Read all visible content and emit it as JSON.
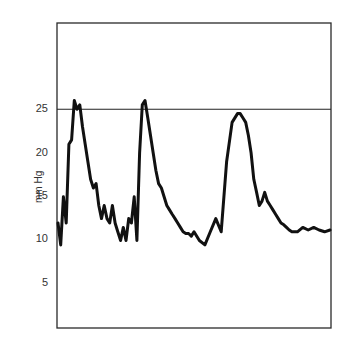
{
  "chart_data": {
    "type": "line",
    "title": "",
    "xlabel": "",
    "ylabel": "mm Hg",
    "ylim": [
      0,
      34
    ],
    "yticks": [
      5,
      10,
      15,
      20,
      25
    ],
    "ytick_labels": [
      "5",
      "10",
      "15",
      "20",
      "25"
    ],
    "reference_line": {
      "y": 25,
      "style": "solid",
      "color": "#222222"
    },
    "grid": false,
    "legend": null,
    "x_axis_ticks": false,
    "series": [
      {
        "name": "pressure waveform",
        "color": "#111111",
        "x": [
          0.0,
          0.01,
          0.02,
          0.03,
          0.04,
          0.05,
          0.06,
          0.07,
          0.08,
          0.09,
          0.1,
          0.11,
          0.12,
          0.13,
          0.14,
          0.15,
          0.16,
          0.17,
          0.18,
          0.19,
          0.2,
          0.21,
          0.22,
          0.23,
          0.24,
          0.25,
          0.26,
          0.27,
          0.28,
          0.29,
          0.3,
          0.31,
          0.32,
          0.33,
          0.34,
          0.35,
          0.36,
          0.37,
          0.38,
          0.39,
          0.4,
          0.41,
          0.42,
          0.43,
          0.44,
          0.45,
          0.46,
          0.47,
          0.48,
          0.49,
          0.5,
          0.52,
          0.54,
          0.56,
          0.58,
          0.6,
          0.62,
          0.64,
          0.66,
          0.67,
          0.68,
          0.69,
          0.7,
          0.71,
          0.72,
          0.73,
          0.74,
          0.75,
          0.76,
          0.77,
          0.78,
          0.79,
          0.8,
          0.81,
          0.82,
          0.83,
          0.84,
          0.85,
          0.86,
          0.87,
          0.88,
          0.9,
          0.92,
          0.94,
          0.96,
          0.98,
          1.0
        ],
        "values": [
          12,
          9.5,
          15,
          12,
          21,
          21.5,
          26,
          25,
          25.5,
          23,
          21,
          19,
          17,
          16,
          16.5,
          14,
          12.5,
          14,
          12.5,
          12,
          14,
          12,
          11,
          10,
          11.5,
          10,
          12.5,
          12,
          15,
          10,
          20,
          25.5,
          26,
          24,
          22,
          20,
          18,
          16.5,
          16,
          15,
          14,
          13.5,
          13,
          12.5,
          12,
          11.5,
          11,
          10.8,
          10.8,
          10.5,
          11,
          10,
          9.5,
          11,
          12.5,
          11,
          19,
          23.5,
          24.5,
          24.5,
          24,
          23.5,
          22,
          20,
          17,
          15.5,
          14,
          14.5,
          15.5,
          14.5,
          14,
          13.5,
          13,
          12.5,
          12,
          11.8,
          11.5,
          11.2,
          11,
          11,
          11,
          11.5,
          11.2,
          11.5,
          11.2,
          11,
          11.2
        ]
      }
    ],
    "plot_box_px": {
      "left": 57,
      "right": 331,
      "top": 23,
      "bottom": 328,
      "zero_y": 328,
      "px_per_unit": 8.75
    }
  }
}
